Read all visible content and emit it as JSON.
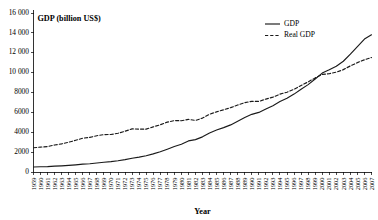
{
  "chart_data": {
    "type": "line",
    "title": "GDP (billion US$)",
    "xlabel": "Year",
    "ylabel": "",
    "grid": false,
    "legend_position": "top-right",
    "ylim": [
      0,
      16000
    ],
    "ytick_step": 2000,
    "ytick_labels": [
      "0",
      "2000",
      "4000",
      "6000",
      "8000",
      "10 000",
      "12 000",
      "14 000",
      "16 000"
    ],
    "ytick_values": [
      0,
      2000,
      4000,
      6000,
      8000,
      10000,
      12000,
      14000,
      16000
    ],
    "categories": [
      "1959",
      "1960",
      "1961",
      "1962",
      "1963",
      "1964",
      "1965",
      "1966",
      "1967",
      "1968",
      "1969",
      "1970",
      "1971",
      "1972",
      "1973",
      "1974",
      "1975",
      "1976",
      "1977",
      "1978",
      "1979",
      "1980",
      "1981",
      "1982",
      "1983",
      "1984",
      "1985",
      "1986",
      "1987",
      "1988",
      "1989",
      "1990",
      "1991",
      "1992",
      "1993",
      "1994",
      "1995",
      "1996",
      "1997",
      "1998",
      "1999",
      "2000",
      "2001",
      "2002",
      "2003",
      "2004",
      "2005",
      "2006",
      "2007"
    ],
    "series": [
      {
        "name": "GDP",
        "style": "solid",
        "color": "#1a1a1a",
        "values": [
          506,
          527,
          545,
          586,
          618,
          664,
          719,
          788,
          833,
          910,
          985,
          1039,
          1128,
          1240,
          1385,
          1501,
          1635,
          1824,
          2031,
          2295,
          2563,
          2790,
          3128,
          3255,
          3537,
          3933,
          4220,
          4463,
          4739,
          5104,
          5484,
          5803,
          5996,
          6338,
          6667,
          7085,
          7415,
          7839,
          8332,
          8794,
          9354,
          9952,
          10286,
          10642,
          11142,
          11853,
          12623,
          13377,
          13808
        ]
      },
      {
        "name": "Real GDP",
        "style": "dashed",
        "color": "#1a1a1a",
        "values": [
          2442,
          2502,
          2560,
          2715,
          2834,
          2999,
          3191,
          3399,
          3485,
          3653,
          3766,
          3772,
          3899,
          4105,
          4342,
          4320,
          4311,
          4541,
          4751,
          5015,
          5173,
          5162,
          5292,
          5189,
          5424,
          5814,
          6054,
          6264,
          6475,
          6743,
          6981,
          7113,
          7101,
          7337,
          7533,
          7836,
          8032,
          8329,
          8704,
          9067,
          9470,
          9817,
          9891,
          10049,
          10301,
          10676,
          11004,
          11295,
          11524
        ]
      }
    ],
    "legend": [
      {
        "label": "GDP",
        "style": "solid"
      },
      {
        "label": "Real GDP",
        "style": "dashed"
      }
    ]
  }
}
